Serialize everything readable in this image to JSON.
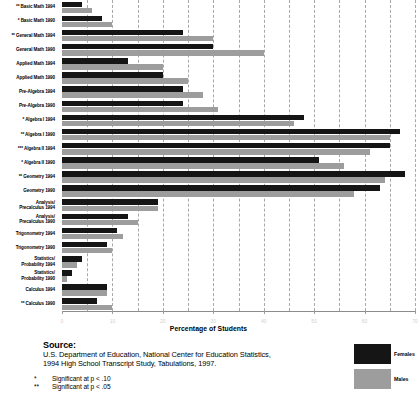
{
  "chart_data": {
    "type": "bar",
    "orientation": "horizontal",
    "title": "",
    "xlabel": "Percentage of Students",
    "ylabel": "",
    "xlim": [
      0,
      70
    ],
    "grid": true,
    "legend_position": "bottom-right",
    "tick_labels": [
      "0",
      "10",
      "20",
      "30",
      "40",
      "50",
      "60",
      "70"
    ],
    "tick_values": [
      0,
      10,
      20,
      30,
      40,
      50,
      60,
      70
    ],
    "categories": [
      "Basic Math 1994",
      "Basic Math 1990",
      "General Math 1994",
      "General Math 1990",
      "Applied Math 1994",
      "Applied Math 1990",
      "Pre-Algebra 1994",
      "Pre-Algebra 1990",
      "Algebra I 1994",
      "Algebra I 1990",
      "Algebra II 1994",
      "Algebra II 1990",
      "Geometry 1994",
      "Geometry 1990",
      "Analysis/\nPrecalculus 1994",
      "Analysis/\nPrecalculus 1990",
      "Trigonometry 1994",
      "Trigonometry 1990",
      "Statistics/\nProbability 1994",
      "Statistics/\nProbability 1990",
      "Calculus 1994",
      "Calculus 1990"
    ],
    "significance_markers": [
      "**",
      "*",
      "**",
      "",
      "",
      "",
      "",
      "",
      "*",
      "**",
      "***",
      "*",
      "**",
      "",
      "",
      "",
      "",
      "",
      "",
      "",
      "",
      "**"
    ],
    "series": [
      {
        "name": "Females",
        "color": "#151515",
        "values": [
          4,
          8,
          24,
          30,
          13,
          20,
          24,
          24,
          48,
          67,
          65,
          51,
          68,
          63,
          19,
          13,
          11,
          9,
          4,
          2,
          9,
          7
        ]
      },
      {
        "name": "Males",
        "color": "#9d9d9d",
        "values": [
          6,
          10,
          30,
          40,
          20,
          25,
          28,
          31,
          46,
          65,
          61,
          56,
          64,
          58,
          19,
          15,
          12,
          10,
          3,
          1,
          9,
          10
        ]
      }
    ]
  },
  "legend": {
    "items": [
      {
        "label": "Females",
        "swatch": "female"
      },
      {
        "label": "Males",
        "swatch": "male"
      }
    ]
  },
  "axis": {
    "title": "Percentage of Students"
  },
  "footer": {
    "source_heading": "Source:",
    "source_lines": [
      "U.S. Department of Education, National Center for Education Statistics,",
      "1994 High School Transcript Study, Tabulations, 1997."
    ],
    "notes": [
      {
        "star": "*",
        "text": "Significant at p < .10"
      },
      {
        "star": "**",
        "text": "Significant at p < .05"
      }
    ]
  }
}
